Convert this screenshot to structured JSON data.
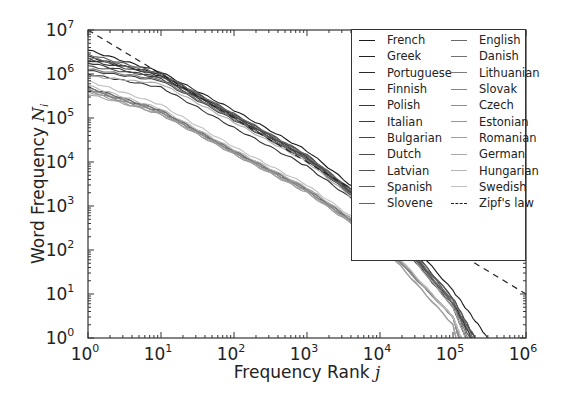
{
  "chart_data": {
    "type": "line",
    "title": "",
    "xlabel": "Frequency Rank j",
    "ylabel": "Word Frequency N_i",
    "xscale": "log",
    "yscale": "log",
    "xlim": [
      1,
      1000000
    ],
    "ylim": [
      1,
      10000000
    ],
    "grid": false,
    "legend_position": "upper right",
    "x_ticks": [
      "10^0",
      "10^1",
      "10^2",
      "10^3",
      "10^4",
      "10^5",
      "10^6"
    ],
    "y_ticks": [
      "10^0",
      "10^1",
      "10^2",
      "10^3",
      "10^4",
      "10^5",
      "10^6",
      "10^7"
    ],
    "series": [
      {
        "name": "French",
        "color": "#1a1a1a",
        "points": [
          [
            1,
            3500000
          ],
          [
            10,
            1100000
          ],
          [
            100,
            150000
          ],
          [
            1000,
            18000
          ],
          [
            10000,
            900
          ],
          [
            100000,
            12
          ],
          [
            300000,
            1
          ]
        ]
      },
      {
        "name": "Greek",
        "color": "#222222",
        "points": [
          [
            1,
            2500000
          ],
          [
            10,
            900000
          ],
          [
            100,
            110000
          ],
          [
            1000,
            12000
          ],
          [
            10000,
            600
          ],
          [
            100000,
            6
          ],
          [
            200000,
            1
          ]
        ]
      },
      {
        "name": "Portuguese",
        "color": "#2a2a2a",
        "points": [
          [
            1,
            2200000
          ],
          [
            10,
            1000000
          ],
          [
            100,
            120000
          ],
          [
            1000,
            14000
          ],
          [
            10000,
            700
          ],
          [
            100000,
            8
          ],
          [
            200000,
            1
          ]
        ]
      },
      {
        "name": "Finnish",
        "color": "#303030",
        "points": [
          [
            1,
            1000000
          ],
          [
            10,
            500000
          ],
          [
            100,
            60000
          ],
          [
            1000,
            8000
          ],
          [
            10000,
            500
          ],
          [
            100000,
            5
          ],
          [
            150000,
            1
          ]
        ]
      },
      {
        "name": "Polish",
        "color": "#363636",
        "points": [
          [
            1,
            1800000
          ],
          [
            10,
            800000
          ],
          [
            100,
            100000
          ],
          [
            1000,
            12000
          ],
          [
            10000,
            600
          ],
          [
            100000,
            6
          ],
          [
            180000,
            1
          ]
        ]
      },
      {
        "name": "Italian",
        "color": "#3d3d3d",
        "points": [
          [
            1,
            2000000
          ],
          [
            10,
            950000
          ],
          [
            100,
            115000
          ],
          [
            1000,
            13000
          ],
          [
            10000,
            650
          ],
          [
            100000,
            7
          ],
          [
            180000,
            1
          ]
        ]
      },
      {
        "name": "Bulgarian",
        "color": "#444444",
        "points": [
          [
            1,
            1200000
          ],
          [
            10,
            700000
          ],
          [
            100,
            90000
          ],
          [
            1000,
            11000
          ],
          [
            10000,
            550
          ],
          [
            100000,
            5
          ],
          [
            150000,
            1
          ]
        ]
      },
      {
        "name": "Dutch",
        "color": "#4a4a4a",
        "points": [
          [
            1,
            1500000
          ],
          [
            10,
            850000
          ],
          [
            100,
            105000
          ],
          [
            1000,
            12500
          ],
          [
            10000,
            620
          ],
          [
            100000,
            6
          ],
          [
            170000,
            1
          ]
        ]
      },
      {
        "name": "Latvian",
        "color": "#525252",
        "points": [
          [
            1,
            500000
          ],
          [
            10,
            150000
          ],
          [
            100,
            18000
          ],
          [
            1000,
            2500
          ],
          [
            10000,
            180
          ],
          [
            100000,
            3
          ],
          [
            130000,
            1
          ]
        ]
      },
      {
        "name": "Spanish",
        "color": "#5a5a5a",
        "points": [
          [
            1,
            2800000
          ],
          [
            10,
            1050000
          ],
          [
            100,
            125000
          ],
          [
            1000,
            14500
          ],
          [
            10000,
            720
          ],
          [
            100000,
            8
          ],
          [
            200000,
            1
          ]
        ]
      },
      {
        "name": "Slovene",
        "color": "#626262",
        "points": [
          [
            1,
            450000
          ],
          [
            10,
            140000
          ],
          [
            100,
            17000
          ],
          [
            1000,
            2300
          ],
          [
            10000,
            160
          ],
          [
            100000,
            3
          ],
          [
            120000,
            1
          ]
        ]
      },
      {
        "name": "English",
        "color": "#6a6a6a",
        "points": [
          [
            1,
            2400000
          ],
          [
            10,
            1000000
          ],
          [
            100,
            120000
          ],
          [
            1000,
            14000
          ],
          [
            10000,
            700
          ],
          [
            100000,
            7
          ],
          [
            190000,
            1
          ]
        ]
      },
      {
        "name": "Danish",
        "color": "#737373",
        "points": [
          [
            1,
            1300000
          ],
          [
            10,
            750000
          ],
          [
            100,
            95000
          ],
          [
            1000,
            11500
          ],
          [
            10000,
            580
          ],
          [
            100000,
            6
          ],
          [
            160000,
            1
          ]
        ]
      },
      {
        "name": "Lithuanian",
        "color": "#7b7b7b",
        "points": [
          [
            1,
            480000
          ],
          [
            10,
            145000
          ],
          [
            100,
            17500
          ],
          [
            1000,
            2400
          ],
          [
            10000,
            170
          ],
          [
            100000,
            3
          ],
          [
            125000,
            1
          ]
        ]
      },
      {
        "name": "Slovak",
        "color": "#848484",
        "points": [
          [
            1,
            420000
          ],
          [
            10,
            130000
          ],
          [
            100,
            16000
          ],
          [
            1000,
            2200
          ],
          [
            10000,
            150
          ],
          [
            100000,
            3
          ],
          [
            120000,
            1
          ]
        ]
      },
      {
        "name": "Czech",
        "color": "#8d8d8d",
        "points": [
          [
            1,
            460000
          ],
          [
            10,
            135000
          ],
          [
            100,
            16500
          ],
          [
            1000,
            2250
          ],
          [
            10000,
            155
          ],
          [
            100000,
            3
          ],
          [
            120000,
            1
          ]
        ]
      },
      {
        "name": "Estonian",
        "color": "#969696",
        "points": [
          [
            1,
            400000
          ],
          [
            10,
            120000
          ],
          [
            100,
            15000
          ],
          [
            1000,
            2000
          ],
          [
            10000,
            140
          ],
          [
            100000,
            2
          ],
          [
            110000,
            1
          ]
        ]
      },
      {
        "name": "Romanian",
        "color": "#a0a0a0",
        "points": [
          [
            1,
            350000
          ],
          [
            10,
            125000
          ],
          [
            100,
            15500
          ],
          [
            1000,
            2100
          ],
          [
            10000,
            145
          ],
          [
            100000,
            2
          ],
          [
            110000,
            1
          ]
        ]
      },
      {
        "name": "German",
        "color": "#aaaaaa",
        "points": [
          [
            1,
            900000
          ],
          [
            10,
            600000
          ],
          [
            100,
            80000
          ],
          [
            1000,
            10000
          ],
          [
            10000,
            500
          ],
          [
            100000,
            5
          ],
          [
            150000,
            1
          ]
        ]
      },
      {
        "name": "Hungarian",
        "color": "#b4b4b4",
        "points": [
          [
            1,
            550000
          ],
          [
            10,
            160000
          ],
          [
            100,
            19000
          ],
          [
            1000,
            2600
          ],
          [
            10000,
            190
          ],
          [
            100000,
            3
          ],
          [
            130000,
            1
          ]
        ]
      },
      {
        "name": "Swedish",
        "color": "#bebebe",
        "points": [
          [
            1,
            700000
          ],
          [
            10,
            200000
          ],
          [
            100,
            22000
          ],
          [
            1000,
            3000
          ],
          [
            10000,
            200
          ],
          [
            100000,
            3
          ],
          [
            130000,
            1
          ]
        ]
      },
      {
        "name": "Zipf's law",
        "color": "#222222",
        "dashed": true,
        "points": [
          [
            1,
            10000000
          ],
          [
            1000000,
            10
          ]
        ]
      }
    ]
  },
  "axes": {
    "xlabel": "Frequency Rank ",
    "xlabel_var": "j",
    "ylabel": "Word Frequency ",
    "ylabel_var": "N",
    "ylabel_sub": "i",
    "x_ticks": [
      {
        "base": "10",
        "exp": "0"
      },
      {
        "base": "10",
        "exp": "1"
      },
      {
        "base": "10",
        "exp": "2"
      },
      {
        "base": "10",
        "exp": "3"
      },
      {
        "base": "10",
        "exp": "4"
      },
      {
        "base": "10",
        "exp": "5"
      },
      {
        "base": "10",
        "exp": "6"
      }
    ],
    "y_ticks": [
      {
        "base": "10",
        "exp": "0"
      },
      {
        "base": "10",
        "exp": "1"
      },
      {
        "base": "10",
        "exp": "2"
      },
      {
        "base": "10",
        "exp": "3"
      },
      {
        "base": "10",
        "exp": "4"
      },
      {
        "base": "10",
        "exp": "5"
      },
      {
        "base": "10",
        "exp": "6"
      },
      {
        "base": "10",
        "exp": "7"
      }
    ]
  },
  "legend": {
    "col1": [
      {
        "label": "French",
        "color": "#1a1a1a"
      },
      {
        "label": "Greek",
        "color": "#222222"
      },
      {
        "label": "Portuguese",
        "color": "#2a2a2a"
      },
      {
        "label": "Finnish",
        "color": "#303030"
      },
      {
        "label": "Polish",
        "color": "#363636"
      },
      {
        "label": "Italian",
        "color": "#3d3d3d"
      },
      {
        "label": "Bulgarian",
        "color": "#444444"
      },
      {
        "label": "Dutch",
        "color": "#4a4a4a"
      },
      {
        "label": "Latvian",
        "color": "#525252"
      },
      {
        "label": "Spanish",
        "color": "#5a5a5a"
      },
      {
        "label": "Slovene",
        "color": "#626262"
      }
    ],
    "col2": [
      {
        "label": "English",
        "color": "#6a6a6a"
      },
      {
        "label": "Danish",
        "color": "#737373"
      },
      {
        "label": "Lithuanian",
        "color": "#7b7b7b"
      },
      {
        "label": "Slovak",
        "color": "#848484"
      },
      {
        "label": "Czech",
        "color": "#8d8d8d"
      },
      {
        "label": "Estonian",
        "color": "#969696"
      },
      {
        "label": "Romanian",
        "color": "#a0a0a0"
      },
      {
        "label": "German",
        "color": "#aaaaaa"
      },
      {
        "label": "Hungarian",
        "color": "#b4b4b4"
      },
      {
        "label": "Swedish",
        "color": "#bebebe"
      },
      {
        "label": "Zipf's law",
        "color": "#222222",
        "dashed": true
      }
    ]
  }
}
